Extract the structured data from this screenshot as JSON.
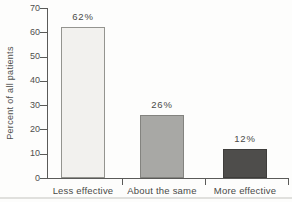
{
  "chart_data": {
    "type": "bar",
    "categories": [
      "Less effective",
      "About the same",
      "More effective"
    ],
    "values": [
      62,
      26,
      12
    ],
    "value_labels": [
      "62%",
      "26%",
      "12%"
    ],
    "title": "",
    "xlabel": "",
    "ylabel": "Percent of all patients",
    "ylim": [
      0,
      70
    ],
    "yticks": [
      0,
      10,
      20,
      30,
      40,
      50,
      60,
      70
    ],
    "grid": false,
    "legend": null,
    "bar_colors": [
      "#f2f1ee",
      "#a8a8a5",
      "#4e4d4b"
    ],
    "bar_border_colors": [
      "#94948f",
      "#83837f",
      "#3e3d3b"
    ]
  },
  "colors": {
    "axis": "#5a5a58",
    "text": "#4a4a48",
    "background": "#fdfdfc"
  }
}
